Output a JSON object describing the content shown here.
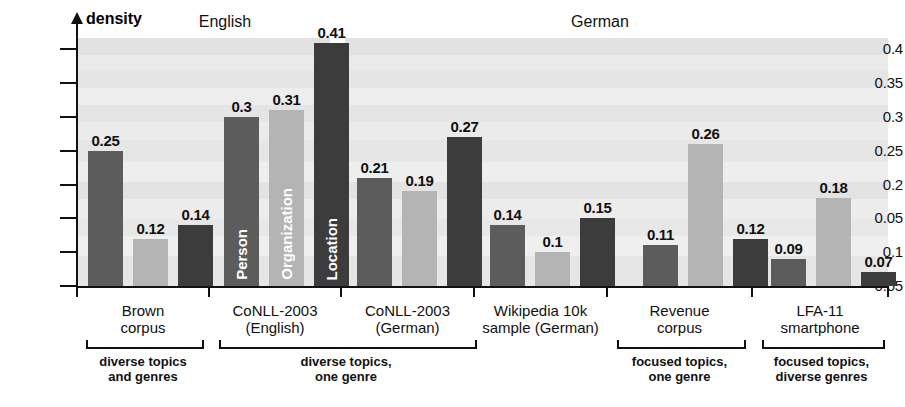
{
  "chart_data": {
    "type": "bar",
    "title": "density",
    "xlabel": "",
    "ylabel": "density",
    "ylim": [
      0.05,
      0.4167
    ],
    "grid": false,
    "legend_position": "in-bar (English CoNLL-2003 group, vertical white text)",
    "y_ticks": [
      "0.4",
      "0.35",
      "0.3",
      "0.25",
      "0.2",
      "0.05",
      "0.1",
      "0.05"
    ],
    "y_tick_values": [
      0.4,
      0.35,
      0.3,
      0.25,
      0.2,
      0.15,
      0.1,
      0.05
    ],
    "series": [
      {
        "name": "Person",
        "color": "#5c5c5c",
        "values": [
          0.25,
          0.3,
          0.21,
          0.14,
          0.11,
          0.09
        ]
      },
      {
        "name": "Organization",
        "color": "#b4b4b4",
        "values": [
          0.12,
          0.31,
          0.19,
          0.1,
          0.26,
          0.18
        ]
      },
      {
        "name": "Location",
        "color": "#3c3c3c",
        "values": [
          0.14,
          0.41,
          0.27,
          0.15,
          0.12,
          0.07
        ]
      }
    ],
    "categories": [
      "Brown corpus",
      "CoNLL-2003 (English)",
      "CoNLL-2003 (German)",
      "Wikipedia 10k sample (German)",
      "Revenue corpus",
      "LFA-11 smartphone"
    ],
    "value_labels": [
      [
        "0.25",
        "0.12",
        "0.14"
      ],
      [
        "0.3",
        "0.31",
        "0.41"
      ],
      [
        "0.21",
        "0.19",
        "0.27"
      ],
      [
        "0.14",
        "0.1",
        "0.15"
      ],
      [
        "0.11",
        "0.26",
        "0.12"
      ],
      [
        "0.09",
        "0.18",
        "0.07"
      ]
    ],
    "language_groups": [
      {
        "label": "English",
        "categories": [
          "Brown corpus",
          "CoNLL-2003 (English)"
        ]
      },
      {
        "label": "German",
        "categories": [
          "CoNLL-2003 (German)",
          "Wikipedia 10k sample (German)",
          "Revenue corpus",
          "LFA-11 smartphone"
        ]
      }
    ],
    "annotations": [
      {
        "label": "diverse topics and genres",
        "covers": [
          "Brown corpus"
        ]
      },
      {
        "label": "diverse topics, one genre",
        "covers": [
          "CoNLL-2003 (English)",
          "CoNLL-2003 (German)",
          "Wikipedia 10k sample (German)"
        ]
      },
      {
        "label": "focused topics, one genre",
        "covers": [
          "Revenue corpus"
        ]
      },
      {
        "label": "focused topics, diverse genres",
        "covers": [
          "LFA-11 smartphone"
        ]
      }
    ]
  },
  "axis": {
    "y_title": "density",
    "ticks": [
      {
        "text": "0.4"
      },
      {
        "text": "0.35"
      },
      {
        "text": "0.3"
      },
      {
        "text": "0.25"
      },
      {
        "text": "0.2"
      },
      {
        "text": "0.05"
      },
      {
        "text": "0.1"
      },
      {
        "text": "0.05"
      }
    ]
  },
  "languages": {
    "english": "English",
    "german": "German"
  },
  "series_names": {
    "person": "Person",
    "organization": "Organization",
    "location": "Location"
  },
  "groups": [
    {
      "line1": "Brown",
      "line2": "corpus",
      "values": {
        "person": "0.25",
        "organization": "0.12",
        "location": "0.14"
      }
    },
    {
      "line1": "CoNLL-2003",
      "line2": "(English)",
      "values": {
        "person": "0.3",
        "organization": "0.31",
        "location": "0.41"
      }
    },
    {
      "line1": "CoNLL-2003",
      "line2": "(German)",
      "values": {
        "person": "0.21",
        "organization": "0.19",
        "location": "0.27"
      }
    },
    {
      "line1": "Wikipedia 10k",
      "line2": "sample (German)",
      "values": {
        "person": "0.14",
        "organization": "0.1",
        "location": "0.15"
      }
    },
    {
      "line1": "Revenue",
      "line2": "corpus",
      "values": {
        "person": "0.11",
        "organization": "0.26",
        "location": "0.12"
      }
    },
    {
      "line1": "LFA-11",
      "line2": "smartphone",
      "values": {
        "person": "0.09",
        "organization": "0.18",
        "location": "0.07"
      }
    }
  ],
  "brackets": [
    {
      "line1": "diverse topics",
      "line2": "and genres"
    },
    {
      "line1": "diverse topics,",
      "line2": "one genre"
    },
    {
      "line1": "focused topics,",
      "line2": "one genre"
    },
    {
      "line1": "focused topics,",
      "line2": "diverse genres"
    }
  ],
  "colors": {
    "person": "#5c5c5c",
    "organization": "#b4b4b4",
    "location": "#3c3c3c",
    "axis": "#111111",
    "plot_background": "#e8e8e8"
  }
}
